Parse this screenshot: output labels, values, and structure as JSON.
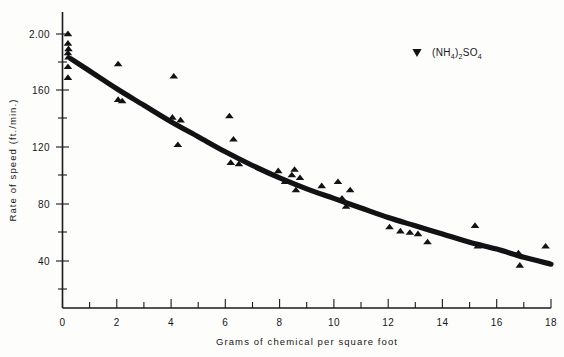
{
  "chart_data": {
    "type": "scatter",
    "title": "",
    "subtitle": "",
    "xlabel": "Grams of chemical per square foot",
    "ylabel": "Rate of speed (ft./min.)",
    "xlim": [
      0,
      18
    ],
    "ylim": [
      0,
      200
    ],
    "grid": false,
    "legend_position": "top-right",
    "x_ticks": [
      0,
      2,
      4,
      6,
      8,
      10,
      12,
      14,
      16,
      18
    ],
    "x_tick_labels": [
      "0",
      "2",
      "4",
      "6",
      "8",
      "10",
      "12",
      "14",
      "16",
      "18"
    ],
    "x_minor_ticks": [
      1,
      3,
      5,
      7,
      9,
      11,
      13,
      15,
      17
    ],
    "y_ticks": [
      40,
      80,
      120,
      160,
      200
    ],
    "y_tick_labels": [
      "40",
      "80",
      "120",
      "160",
      "2.00"
    ],
    "y_minor_ticks": [
      20,
      60,
      100,
      140,
      180
    ],
    "series": [
      {
        "name": "(NH4)2SO4",
        "marker": "triangle-up",
        "color": "#131316",
        "points": [
          [
            0.2,
            200
          ],
          [
            0.2,
            193
          ],
          [
            0.22,
            189
          ],
          [
            0.2,
            186
          ],
          [
            0.22,
            183
          ],
          [
            0.2,
            176
          ],
          [
            0.2,
            168
          ],
          [
            2.05,
            178
          ],
          [
            2.05,
            152
          ],
          [
            2.2,
            151
          ],
          [
            4.1,
            169
          ],
          [
            4.05,
            139
          ],
          [
            4.35,
            137
          ],
          [
            4.25,
            119
          ],
          [
            6.15,
            140
          ],
          [
            6.3,
            123
          ],
          [
            6.2,
            106
          ],
          [
            6.5,
            105
          ],
          [
            7.95,
            100
          ],
          [
            8.2,
            92
          ],
          [
            8.45,
            97
          ],
          [
            8.55,
            101
          ],
          [
            8.75,
            95
          ],
          [
            8.6,
            86
          ],
          [
            9.55,
            89
          ],
          [
            10.15,
            92
          ],
          [
            10.3,
            80
          ],
          [
            10.45,
            74
          ],
          [
            10.6,
            86
          ],
          [
            12.05,
            59
          ],
          [
            12.45,
            56
          ],
          [
            12.8,
            55
          ],
          [
            13.1,
            54
          ],
          [
            13.45,
            48
          ],
          [
            15.2,
            60
          ],
          [
            15.3,
            45
          ],
          [
            16.8,
            40
          ],
          [
            16.85,
            31
          ],
          [
            17.8,
            45
          ]
        ]
      }
    ],
    "trend_line": {
      "label": "fitted curve",
      "points": [
        [
          0.3,
          182
        ],
        [
          1.0,
          173
        ],
        [
          2.0,
          160
        ],
        [
          3.0,
          148
        ],
        [
          4.0,
          136
        ],
        [
          5.0,
          125
        ],
        [
          6.0,
          114
        ],
        [
          7.0,
          104
        ],
        [
          8.0,
          95
        ],
        [
          9.0,
          87
        ],
        [
          10.0,
          80
        ],
        [
          11.0,
          73
        ],
        [
          12.0,
          66
        ],
        [
          13.0,
          60
        ],
        [
          14.0,
          54
        ],
        [
          15.0,
          48
        ],
        [
          16.0,
          43
        ],
        [
          17.0,
          37
        ],
        [
          18.0,
          32
        ]
      ]
    }
  },
  "legend": {
    "entries": [
      {
        "marker_name": "triangle-marker",
        "formula_open": "(NH",
        "formula_sub1": "4",
        "formula_close": ")",
        "formula_sub2": "2",
        "formula_tail": "SO",
        "formula_sub3": "4"
      }
    ]
  },
  "axes": {
    "x_title": "Grams of chemical per square foot",
    "y_title": "Rate of speed (ft./min.)"
  }
}
